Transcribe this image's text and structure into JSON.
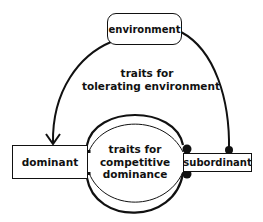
{
  "diagram": {
    "nodes": {
      "environment": "environment",
      "dominant": "dominant",
      "subordinant": "subordinant"
    },
    "labels": {
      "tolerating_line1": "traits for",
      "tolerating_line2": "tolerating environment",
      "competitive_line1": "traits for",
      "competitive_line2": "competitive",
      "competitive_line3": "dominance"
    },
    "edges": [
      {
        "from": "environment",
        "to": "dominant",
        "head": "arrow",
        "label": "traits for tolerating environment"
      },
      {
        "from": "environment",
        "to": "subordinant",
        "head": "dot",
        "label": "traits for tolerating environment"
      },
      {
        "from": "dominant",
        "to": "subordinant",
        "head": "dot",
        "label": "traits for competitive dominance"
      },
      {
        "from": "subordinant",
        "to": "dominant",
        "head": "small-dot",
        "label": "traits for competitive dominance"
      }
    ],
    "colors": {
      "ink": "#111111",
      "background": "#ffffff"
    }
  }
}
